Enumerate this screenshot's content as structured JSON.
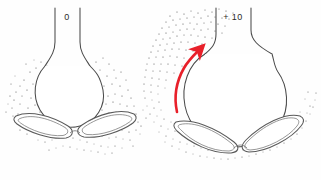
{
  "figure": {
    "type": "anatomical-line-drawing",
    "background_color": "#fefefe",
    "ink_color": "#4a4a4a",
    "stipple_color": "#555555",
    "accent_color": "#e8202a",
    "panels": [
      {
        "id": "panel-left",
        "label": "0",
        "state": "closed",
        "description": "Narrow undilated canal with rounded bulb and paired lens-shaped bodies below"
      },
      {
        "id": "panel-right",
        "label": "+ 10",
        "state": "open",
        "description": "Widely splayed canal with large open bulb, flattened paired lens-shaped bodies and red directional arrow"
      }
    ],
    "annotations": [
      {
        "id": "motion-arrow",
        "color": "#e8202a",
        "direction": "upward-curving",
        "panel": "panel-right"
      }
    ]
  }
}
